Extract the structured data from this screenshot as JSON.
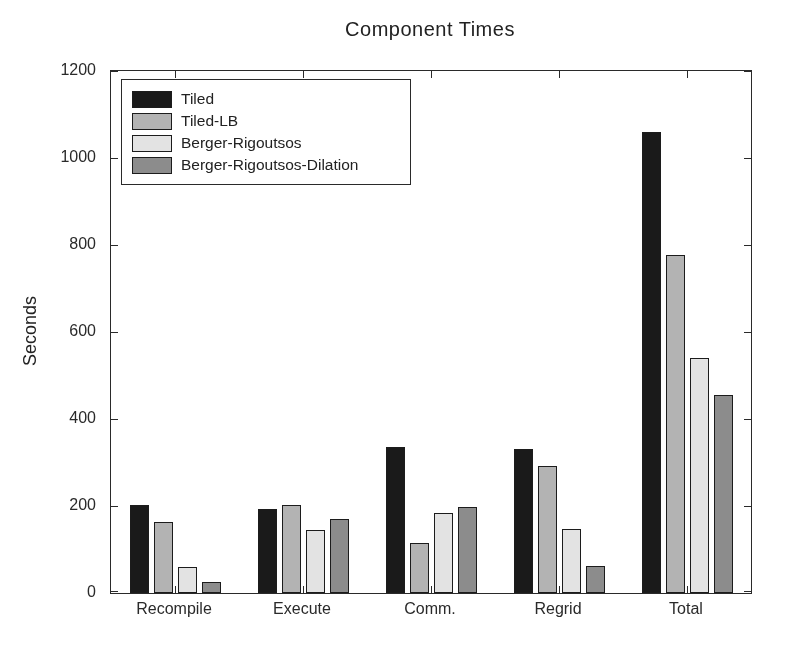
{
  "figure": {
    "title": "Component Times",
    "ylabel": "Seconds"
  },
  "chart_data": {
    "type": "bar",
    "title": "Component Times",
    "xlabel": "",
    "ylabel": "Seconds",
    "categories": [
      "Recompile",
      "Execute",
      "Comm.",
      "Regrid",
      "Total"
    ],
    "series": [
      {
        "name": "Tiled",
        "color": "#1a1a1a",
        "values": [
          203,
          192,
          336,
          330,
          1060
        ]
      },
      {
        "name": "Tiled-LB",
        "color": "#b3b3b3",
        "values": [
          163,
          203,
          115,
          293,
          778
        ]
      },
      {
        "name": "Berger-Rigoutsos",
        "color": "#e3e3e3",
        "values": [
          60,
          145,
          183,
          148,
          540
        ]
      },
      {
        "name": "Berger-Rigoutsos-Dilation",
        "color": "#8c8c8c",
        "values": [
          25,
          170,
          198,
          62,
          455
        ]
      }
    ],
    "ylim": [
      0,
      1200
    ],
    "yticks": [
      0,
      200,
      400,
      600,
      800,
      1000,
      1200
    ],
    "grid": false,
    "legend_position": "upper-left",
    "axis_color": "#2a2a2a",
    "bar_edge_color": "#1c1c1c",
    "background_color": "#ffffff"
  }
}
